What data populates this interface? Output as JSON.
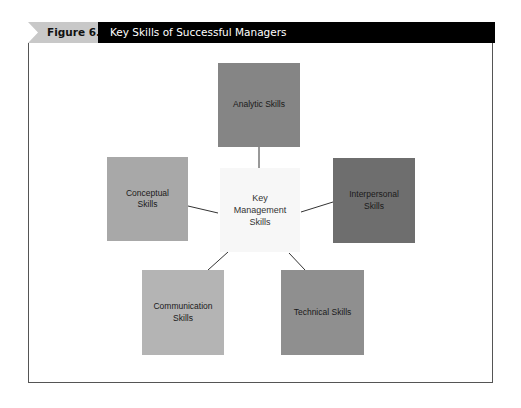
{
  "header": {
    "figure_number": "Figure 6.8",
    "title": "Key Skills of Successful Managers"
  },
  "diagram": {
    "center": {
      "label_lines": [
        "Key",
        "Management",
        "Skills"
      ],
      "color": "#f7f7f7"
    },
    "nodes": [
      {
        "id": "analytic",
        "label": "Analytic Skills",
        "color": "#858585"
      },
      {
        "id": "conceptual",
        "label": "Conceptual Skills",
        "color": "#a8a8a8"
      },
      {
        "id": "interpersonal",
        "label": "Interpersonal Skills",
        "color": "#6e6e6e"
      },
      {
        "id": "communication",
        "label": "Communication Skills",
        "color": "#b4b4b4"
      },
      {
        "id": "technical",
        "label": "Technical Skills",
        "color": "#8f8f8f"
      }
    ]
  },
  "colors": {
    "header_bg": "#000000",
    "figure_tag_bg": "#c8c8c8",
    "connector": "#333333",
    "frame_border": "#555555"
  }
}
